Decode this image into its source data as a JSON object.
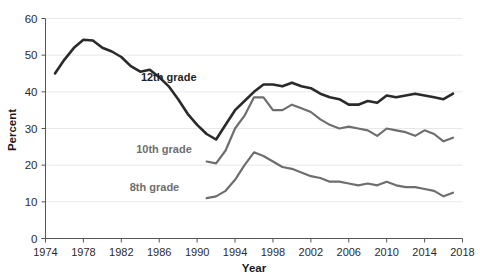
{
  "chart_data": {
    "type": "line",
    "title": "",
    "xlabel": "Year",
    "ylabel": "Percent",
    "xlim": [
      1974,
      2018
    ],
    "ylim": [
      0,
      60
    ],
    "grid": "horizontal",
    "legend_position": "inline-annotations",
    "xticks": [
      1974,
      1978,
      1982,
      1986,
      1990,
      1994,
      1998,
      2002,
      2006,
      2010,
      2014,
      2018
    ],
    "yticks": [
      0,
      10,
      20,
      30,
      40,
      50,
      60
    ],
    "colors": {
      "grade12": "#2a2a2a",
      "grade10": "#6e6e6e",
      "grade8": "#6e6e6e",
      "gridline": "#e8e8e8",
      "axis": "#555555",
      "text": "#2b2b2b",
      "background": "#ffffff"
    },
    "series": [
      {
        "name": "12th grade",
        "color": "#2a2a2a",
        "label_x": 1987.0,
        "label_y": 44.0,
        "x": [
          1975,
          1976,
          1977,
          1978,
          1979,
          1980,
          1981,
          1982,
          1983,
          1984,
          1985,
          1986,
          1987,
          1988,
          1989,
          1990,
          1991,
          1992,
          1993,
          1994,
          1995,
          1996,
          1997,
          1998,
          1999,
          2000,
          2001,
          2002,
          2003,
          2004,
          2005,
          2006,
          2007,
          2008,
          2009,
          2010,
          2011,
          2012,
          2013,
          2014,
          2015,
          2016,
          2017
        ],
        "values": [
          45.0,
          48.8,
          52.0,
          54.2,
          54.0,
          52.0,
          51.0,
          49.5,
          47.0,
          45.5,
          46.0,
          44.0,
          41.5,
          38.0,
          34.0,
          31.0,
          28.5,
          27.0,
          31.0,
          35.0,
          37.5,
          40.0,
          42.0,
          42.0,
          41.5,
          42.5,
          41.5,
          41.0,
          39.5,
          38.5,
          38.0,
          36.5,
          36.5,
          37.5,
          37.0,
          39.0,
          38.5,
          39.0,
          39.5,
          39.0,
          38.5,
          38.0,
          39.5
        ]
      },
      {
        "name": "10th grade",
        "color": "#6e6e6e",
        "label_x": 1986.5,
        "label_y": 24.5,
        "x": [
          1991,
          1992,
          1993,
          1994,
          1995,
          1996,
          1997,
          1998,
          1999,
          2000,
          2001,
          2002,
          2003,
          2004,
          2005,
          2006,
          2007,
          2008,
          2009,
          2010,
          2011,
          2012,
          2013,
          2014,
          2015,
          2016,
          2017
        ],
        "values": [
          21.0,
          20.5,
          24.0,
          30.0,
          33.5,
          38.5,
          38.5,
          35.0,
          35.0,
          36.5,
          35.5,
          34.5,
          32.5,
          31.0,
          30.0,
          30.5,
          30.0,
          29.5,
          28.0,
          30.0,
          29.5,
          29.0,
          28.0,
          29.5,
          28.5,
          26.5,
          27.5
        ]
      },
      {
        "name": "8th grade",
        "color": "#6e6e6e",
        "label_x": 1985.5,
        "label_y": 14.0,
        "x": [
          1991,
          1992,
          1993,
          1994,
          1995,
          1996,
          1997,
          1998,
          1999,
          2000,
          2001,
          2002,
          2003,
          2004,
          2005,
          2006,
          2007,
          2008,
          2009,
          2010,
          2011,
          2012,
          2013,
          2014,
          2015,
          2016,
          2017
        ],
        "values": [
          11.0,
          11.5,
          13.0,
          16.0,
          20.0,
          23.5,
          22.5,
          21.0,
          19.5,
          19.0,
          18.0,
          17.0,
          16.5,
          15.5,
          15.5,
          15.0,
          14.5,
          15.0,
          14.5,
          15.5,
          14.5,
          14.0,
          14.0,
          13.5,
          13.0,
          11.5,
          12.5
        ]
      }
    ]
  },
  "axes": {
    "y_label": "Percent",
    "x_label": "Year",
    "y_ticks": [
      "0",
      "10",
      "20",
      "30",
      "40",
      "50",
      "60"
    ],
    "x_ticks": [
      "1974",
      "1978",
      "1982",
      "1986",
      "1990",
      "1994",
      "1998",
      "2002",
      "2006",
      "2010",
      "2014",
      "2018"
    ]
  },
  "annotations": {
    "grade12_label": "12th grade",
    "grade10_label": "10th grade",
    "grade8_label": "8th grade"
  }
}
